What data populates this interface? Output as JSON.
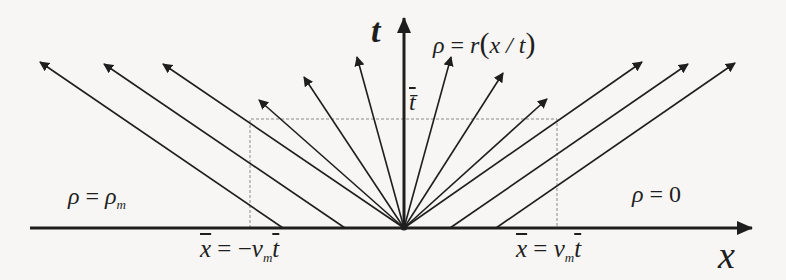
{
  "diagram": {
    "colors": {
      "background": "#f7f6f4",
      "ink": "#1e1e1e",
      "dashed": "#8a8a8a"
    },
    "axes": {
      "x_label": "x",
      "t_label": "t",
      "t_bar_label": "t̄"
    },
    "labels": {
      "fan_region": {
        "rho": "ρ",
        "eq": " = ",
        "r": "r",
        "lp": "(",
        "arg": "x / t",
        "rp": ")"
      },
      "left_region": {
        "rho": "ρ",
        "eq": " = ",
        "rho2": "ρ",
        "sub": "m"
      },
      "right_region": {
        "rho": "ρ",
        "eq": " = ",
        "val": "0"
      },
      "left_xbar": {
        "x": "x",
        "eq": " = −",
        "v": "v",
        "sub": "m",
        "t": "t"
      },
      "right_xbar": {
        "x": "x",
        "eq": " = ",
        "v": "v",
        "sub": "m",
        "t": "t"
      }
    },
    "origin": [
      404,
      228
    ],
    "arrows": [
      {
        "from": [
          283,
          228
        ],
        "to": [
          40,
          62
        ]
      },
      {
        "from": [
          345,
          228
        ],
        "to": [
          104,
          64
        ]
      },
      {
        "from": [
          404,
          228
        ],
        "to": [
          163,
          64
        ]
      },
      {
        "from": [
          404,
          228
        ],
        "to": [
          259,
          100
        ]
      },
      {
        "from": [
          404,
          228
        ],
        "to": [
          304,
          77
        ]
      },
      {
        "from": [
          404,
          228
        ],
        "to": [
          357,
          57
        ]
      },
      {
        "from": [
          404,
          228
        ],
        "to": [
          451,
          57
        ]
      },
      {
        "from": [
          404,
          228
        ],
        "to": [
          503,
          73
        ]
      },
      {
        "from": [
          404,
          228
        ],
        "to": [
          547,
          99
        ]
      },
      {
        "from": [
          404,
          228
        ],
        "to": [
          642,
          62
        ]
      },
      {
        "from": [
          450,
          228
        ],
        "to": [
          688,
          64
        ]
      },
      {
        "from": [
          496,
          228
        ],
        "to": [
          735,
          63
        ]
      }
    ],
    "dashed_box": {
      "x1": 250,
      "x2": 557,
      "y_top": 119,
      "y_bottom": 228
    }
  }
}
